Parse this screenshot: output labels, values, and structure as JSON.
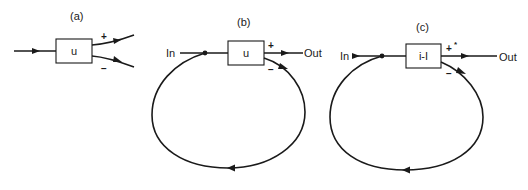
{
  "panels": [
    {
      "id": "a",
      "label": "(a)",
      "box_label": "u",
      "plus_sign": "+",
      "minus_sign": "−"
    },
    {
      "id": "b",
      "label": "(b)",
      "box_label": "u",
      "input_label": "In",
      "output_label": "Out",
      "plus_sign": "+",
      "minus_sign": "−"
    },
    {
      "id": "c",
      "label": "(c)",
      "box_label": "i-I",
      "input_label": "In",
      "output_label": "Out",
      "plus_sign": "+",
      "minus_sign": "−",
      "extra_mark": "*"
    }
  ],
  "colors": {
    "ink": "#1a1a1a",
    "background": "#ffffff"
  }
}
